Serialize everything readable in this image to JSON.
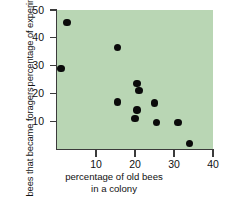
{
  "chart_data": {
    "type": "scatter",
    "title": "",
    "xlabel": "percentage of old bees in a colony",
    "xlabel_line1": "percentage of old bees",
    "xlabel_line2": "in a colony",
    "ylabel": "percentage of experimental bees that became foragers",
    "ylabel_line1": "percentage of experimental",
    "ylabel_line2": "bees that became foragers",
    "xlim": [
      0,
      40
    ],
    "ylim": [
      0,
      50
    ],
    "xticks": [
      10,
      20,
      30,
      40
    ],
    "yticks": [
      10,
      20,
      30,
      40,
      50
    ],
    "grid": false,
    "legend": null,
    "plot_background_color": "#b9d6b4",
    "marker_color": "#0b0b0b",
    "axis_color": "#3b3b3b",
    "points": [
      {
        "x": 1.0,
        "y": 29.0
      },
      {
        "x": 2.5,
        "y": 45.5
      },
      {
        "x": 15.5,
        "y": 36.5
      },
      {
        "x": 15.5,
        "y": 17.0
      },
      {
        "x": 20.0,
        "y": 11.0
      },
      {
        "x": 20.5,
        "y": 23.5
      },
      {
        "x": 20.5,
        "y": 14.0
      },
      {
        "x": 21.0,
        "y": 21.0
      },
      {
        "x": 25.0,
        "y": 16.5
      },
      {
        "x": 25.5,
        "y": 9.5
      },
      {
        "x": 31.0,
        "y": 9.5
      },
      {
        "x": 34.0,
        "y": 2.0
      }
    ]
  }
}
